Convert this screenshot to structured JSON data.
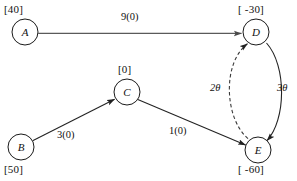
{
  "diagram": {
    "width": 297,
    "height": 181,
    "background": "#ffffff",
    "node_stroke": "#1a1a1a",
    "arc_color": "#5a5a5a",
    "arc_dark_color": "#232323",
    "dashed_arc_color": "#3a3a3a"
  },
  "nodes": [
    {
      "id": "A",
      "name": "A",
      "supply": "[40]",
      "cx": 25,
      "cy": 32,
      "r": 13,
      "supply_x": 4,
      "supply_y": 4,
      "name_x": 12,
      "name_y": 27
    },
    {
      "id": "B",
      "name": "B",
      "supply": "[50]",
      "cx": 21,
      "cy": 147,
      "r": 13,
      "supply_x": 4,
      "supply_y": 164,
      "name_x": 8,
      "name_y": 142
    },
    {
      "id": "C",
      "name": "C",
      "supply": "[0]",
      "cx": 127,
      "cy": 92,
      "r": 13,
      "supply_x": 118,
      "supply_y": 64,
      "name_x": 114,
      "name_y": 87
    },
    {
      "id": "D",
      "name": "D",
      "supply": "[ -30]",
      "cx": 256,
      "cy": 32,
      "r": 13,
      "supply_x": 238,
      "supply_y": 4,
      "name_x": 243,
      "name_y": 27
    },
    {
      "id": "E",
      "name": "E",
      "supply": "[ -60]",
      "cx": 258,
      "cy": 150,
      "r": 13,
      "supply_x": 238,
      "supply_y": 164,
      "name_x": 245,
      "name_y": 145
    }
  ],
  "arcs": [
    {
      "id": "A-D",
      "from": "A",
      "to": "D",
      "label": "9(0)",
      "style": "solid",
      "label_x": 121,
      "label_y": 12
    },
    {
      "id": "B-C",
      "from": "B",
      "to": "C",
      "label": "3(0)",
      "style": "solid",
      "label_x": 57,
      "label_y": 130
    },
    {
      "id": "C-E",
      "from": "C",
      "to": "E",
      "label": "1(0)",
      "style": "solid",
      "label_x": 169,
      "label_y": 126
    },
    {
      "id": "E-D",
      "from": "E",
      "to": "D",
      "label": "2θ",
      "style": "dashed",
      "label_x": 210,
      "label_y": 83
    },
    {
      "id": "D-E",
      "from": "D",
      "to": "E",
      "label": "3θ",
      "style": "solid",
      "label_x": 277,
      "label_y": 83
    }
  ]
}
